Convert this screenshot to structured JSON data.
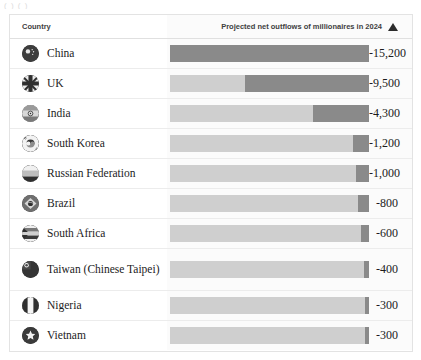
{
  "artifact_text": "( )    ( )",
  "table": {
    "columns": {
      "country": "Country",
      "metric": "Projected net outflows of millionaires in 2024",
      "sort_icon": "sort-ascending-triangle-icon"
    }
  },
  "chart_data": {
    "type": "bar",
    "title": "Projected net outflows of millionaires in 2024",
    "xlabel": "",
    "ylabel": "Country",
    "orientation": "horizontal",
    "grid": false,
    "legend": false,
    "sorted": "descending by magnitude",
    "max_magnitude": 15200,
    "categories": [
      "China",
      "UK",
      "India",
      "South Korea",
      "Russian Federation",
      "Brazil",
      "South Africa",
      "Taiwan (Chinese Taipei)",
      "Nigeria",
      "Vietnam"
    ],
    "values": [
      -15200,
      -9500,
      -4300,
      -1200,
      -1000,
      -800,
      -600,
      -400,
      -300,
      -300
    ],
    "value_labels": [
      "-15,200",
      "-9,500",
      "-4,300",
      "-1,200",
      "-1,000",
      "-800",
      "-600",
      "-400",
      "-300",
      "-300"
    ]
  },
  "rows": [
    {
      "name": "China",
      "flag": "flag-china-icon",
      "value_label": "-15,200",
      "value": -15200,
      "pct": 100.0,
      "tall": false
    },
    {
      "name": "UK",
      "flag": "flag-uk-icon",
      "value_label": "-9,500",
      "value": -9500,
      "pct": 62.5,
      "tall": false
    },
    {
      "name": "India",
      "flag": "flag-india-icon",
      "value_label": "-4,300",
      "value": -4300,
      "pct": 28.3,
      "tall": false
    },
    {
      "name": "South Korea",
      "flag": "flag-south-korea-icon",
      "value_label": "-1,200",
      "value": -1200,
      "pct": 7.9,
      "tall": false
    },
    {
      "name": "Russian Federation",
      "flag": "flag-russia-icon",
      "value_label": "-1,000",
      "value": -1000,
      "pct": 6.6,
      "tall": false
    },
    {
      "name": "Brazil",
      "flag": "flag-brazil-icon",
      "value_label": "-800",
      "value": -800,
      "pct": 5.3,
      "tall": false
    },
    {
      "name": "South Africa",
      "flag": "flag-south-africa-icon",
      "value_label": "-600",
      "value": -600,
      "pct": 3.9,
      "tall": false
    },
    {
      "name": "Taiwan (Chinese Taipei)",
      "flag": "flag-taiwan-icon",
      "value_label": "-400",
      "value": -400,
      "pct": 2.6,
      "tall": true
    },
    {
      "name": "Nigeria",
      "flag": "flag-nigeria-icon",
      "value_label": "-300",
      "value": -300,
      "pct": 2.0,
      "tall": false
    },
    {
      "name": "Vietnam",
      "flag": "flag-vietnam-icon",
      "value_label": "-300",
      "value": -300,
      "pct": 2.0,
      "tall": false
    }
  ],
  "colors": {
    "bar_fill": "#8a8a8a",
    "bar_track": "#cfcfcf",
    "chart_cell_bg": "#fbfbfb",
    "text": "#1c1c1c",
    "border": "#ececec"
  }
}
